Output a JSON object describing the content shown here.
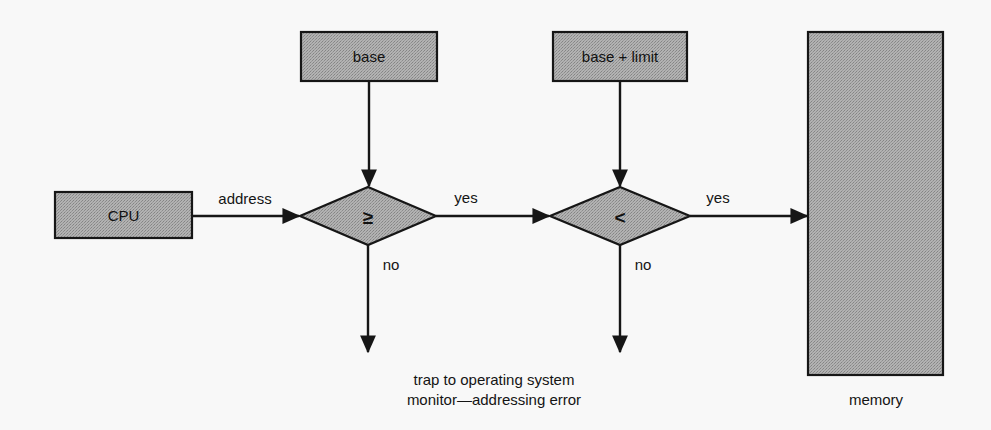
{
  "diagram": {
    "background_color": "#f8f8f8",
    "shape_fill_color": "#a9a9a9",
    "shape_stroke_color": "#161616",
    "text_color": "#111111",
    "nodes": {
      "cpu": {
        "label": "CPU",
        "shape": "rectangle"
      },
      "base": {
        "label": "base",
        "shape": "rectangle"
      },
      "base_limit": {
        "label": "base + limit",
        "shape": "rectangle"
      },
      "decision_ge": {
        "label": "≥",
        "shape": "diamond"
      },
      "decision_lt": {
        "label": "<",
        "shape": "diamond"
      },
      "memory": {
        "label": "memory",
        "shape": "rectangle"
      }
    },
    "edges": {
      "cpu_to_ge": "address",
      "ge_to_lt": "yes",
      "ge_to_trap": "no",
      "lt_to_memory": "yes",
      "lt_to_trap": "no"
    },
    "trap_message": {
      "line1": "trap to operating system",
      "line2": "monitor—addressing error"
    }
  }
}
